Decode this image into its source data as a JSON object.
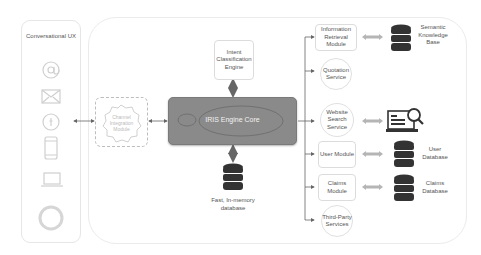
{
  "left_panel": {
    "title": "Conversational UX",
    "icons": [
      "at-sign-icon",
      "email-icon",
      "facebook-icon",
      "phone-icon",
      "laptop-icon",
      "voice-assistant-ring-icon"
    ]
  },
  "channel_module": {
    "label": "Channel Integration Module"
  },
  "engine": {
    "label": "IRIS Engine Core",
    "color": "#8a8a8a"
  },
  "intent": {
    "label": "Intent Classification Engine"
  },
  "memory_db": {
    "label": "Fast, In-memory database"
  },
  "services": [
    {
      "label": "Information Retrieval Module",
      "shape": "box",
      "target": "Semantic Knowledge Base",
      "target_icon": "database-icon"
    },
    {
      "label": "Quotation Service",
      "shape": "circle"
    },
    {
      "label": "Website Search Service",
      "shape": "circle",
      "target_icon": "web-search-icon"
    },
    {
      "label": "User Module",
      "shape": "box",
      "target": "User Database",
      "target_icon": "database-icon"
    },
    {
      "label": "Claims Module",
      "shape": "box",
      "target": "Claims Database",
      "target_icon": "database-icon"
    },
    {
      "label": "Third-Party Services",
      "shape": "circle"
    }
  ]
}
